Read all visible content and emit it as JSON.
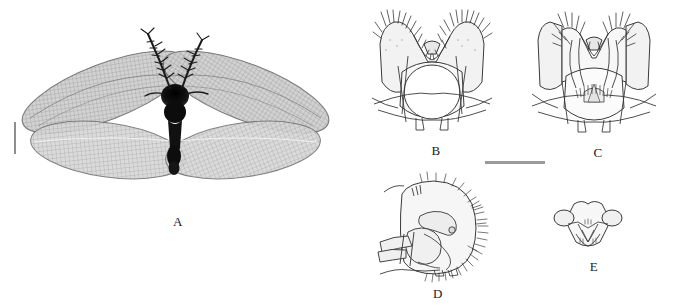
{
  "figure": {
    "kind": "taxonomic-plate",
    "background_color": "#ffffff",
    "ink_color": "#2b2b2b",
    "width": 675,
    "height": 306
  },
  "panels": [
    {
      "id": "A",
      "label": "A",
      "name": "panel-a-habitus",
      "description": "whole insect habitus, dorsal view, wings spread",
      "kind": "photograph",
      "label_x": 166,
      "label_y": 214,
      "features": [
        "plumose antennae",
        "dark head and thorax",
        "two pairs of mesh-veined wings",
        "slender dark abdomen"
      ]
    },
    {
      "id": "B",
      "label": "B",
      "name": "panel-b-genitalia-dorsal",
      "description": "genitalia, dorsal view with paired setose lobes and central ring",
      "kind": "line-drawing",
      "label_x": 424,
      "label_y": 143
    },
    {
      "id": "C",
      "label": "C",
      "name": "panel-c-genitalia-ventral",
      "description": "genitalia, ventral view with paired curved setose arms and comb",
      "kind": "line-drawing",
      "label_x": 586,
      "label_y": 145
    },
    {
      "id": "D",
      "label": "D",
      "name": "panel-d-genitalia-lateral",
      "description": "genitalia, lateral view, ectoproct with marginal setae",
      "kind": "line-drawing",
      "label_x": 426,
      "label_y": 286
    },
    {
      "id": "E",
      "label": "E",
      "name": "panel-e-sclerite",
      "description": "small shield-shaped sclerite, posterior view",
      "kind": "line-drawing",
      "label_x": 582,
      "label_y": 259
    }
  ],
  "scale_bars": [
    {
      "name": "scale-bar-panel-a",
      "orientation": "vertical",
      "x": 14,
      "y": 122,
      "length": 32,
      "thickness": 2,
      "color": "#8e8e8e"
    },
    {
      "name": "scale-bar-genitalia",
      "orientation": "horizontal",
      "x": 485,
      "y": 161,
      "length": 60,
      "thickness": 3,
      "color": "#9a9a9a"
    }
  ]
}
